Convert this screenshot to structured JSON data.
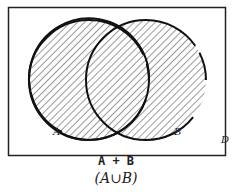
{
  "diagram": {
    "type": "venn",
    "universe_label": "D",
    "sets": [
      {
        "label": "A",
        "shaded": true
      },
      {
        "label": "B",
        "shaded": true
      }
    ],
    "shaded_region": "union",
    "caption_line1": "A + B",
    "caption_line2": "(A∪B)"
  }
}
